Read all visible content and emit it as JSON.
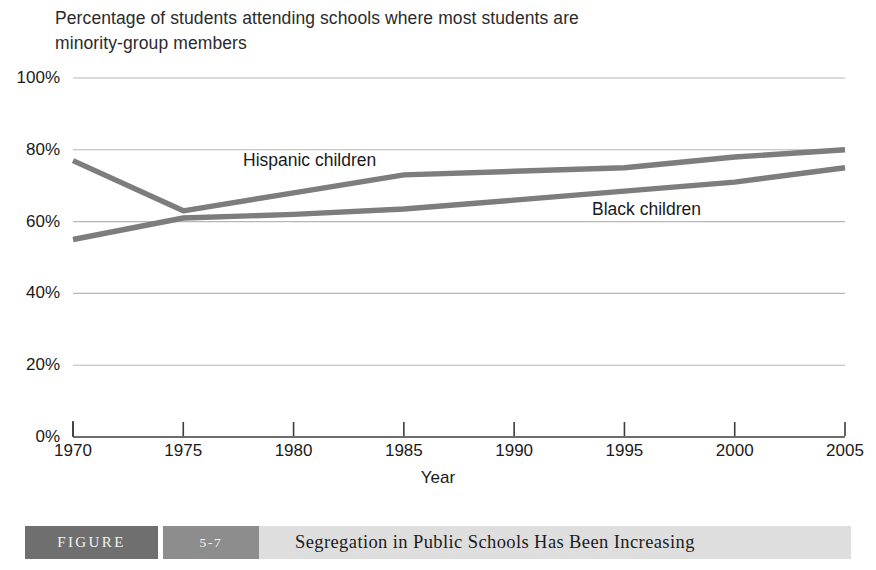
{
  "chart_data": {
    "type": "line",
    "title": "Percentage of students attending schools where most students are minority-group members",
    "title_lines": [
      "Percentage of students attending schools where most students are",
      "minority-group members"
    ],
    "xlabel": "Year",
    "ylabel": "",
    "grid": true,
    "legend_position": "inline-annotations",
    "xlim": [
      1970,
      2005
    ],
    "ylim": [
      0,
      100
    ],
    "x": [
      1970,
      1975,
      1980,
      1985,
      1990,
      1995,
      2000,
      2005
    ],
    "xticks": [
      "1970",
      "1975",
      "1980",
      "1985",
      "1990",
      "1995",
      "2000",
      "2005"
    ],
    "yticks": [
      "0%",
      "20%",
      "40%",
      "60%",
      "80%",
      "100%"
    ],
    "ytick_values": [
      0,
      20,
      40,
      60,
      80,
      100
    ],
    "series": [
      {
        "name": "Hispanic children",
        "color": "#7d7d7d",
        "values": [
          77,
          63,
          68,
          73,
          74,
          75,
          78,
          80
        ]
      },
      {
        "name": "Black children",
        "color": "#7d7d7d",
        "values": [
          55,
          61,
          62,
          63.5,
          66,
          68.5,
          71,
          75
        ]
      }
    ],
    "annotations": [
      {
        "text": "Hispanic children",
        "x": 1978,
        "y": 73
      },
      {
        "text": "Black children",
        "x": 1995,
        "y": 66
      }
    ]
  },
  "caption": {
    "figure_word": "FIGURE",
    "figure_number": "5-7",
    "caption_text": "Segregation in Public Schools Has Been Increasing"
  },
  "colors": {
    "line": "#7d7d7d",
    "grid": "#b7b7b7",
    "axis": "#3c3c3c",
    "caption_dark": "#6f6f6f",
    "caption_mid": "#8d8d8d",
    "caption_light": "#dedede",
    "text": "#1a1a1a"
  }
}
